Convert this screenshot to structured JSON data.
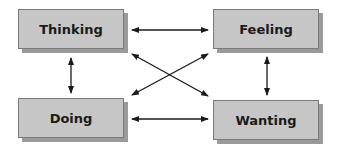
{
  "diagram": {
    "nodes": [
      {
        "id": "thinking",
        "label": "Thinking"
      },
      {
        "id": "feeling",
        "label": "Feeling"
      },
      {
        "id": "doing",
        "label": "Doing"
      },
      {
        "id": "wanting",
        "label": "Wanting"
      }
    ],
    "edges": [
      {
        "from": "thinking",
        "to": "feeling",
        "direction": "both"
      },
      {
        "from": "thinking",
        "to": "doing",
        "direction": "both"
      },
      {
        "from": "feeling",
        "to": "wanting",
        "direction": "both"
      },
      {
        "from": "doing",
        "to": "wanting",
        "direction": "both"
      },
      {
        "from": "thinking",
        "to": "wanting",
        "direction": "both"
      },
      {
        "from": "feeling",
        "to": "doing",
        "direction": "both"
      }
    ],
    "colors": {
      "box_fill": "#c6c6c6",
      "box_shadow": "#9a9a9a",
      "border": "#7a7a7a",
      "arrow": "#1a1a1a"
    }
  }
}
